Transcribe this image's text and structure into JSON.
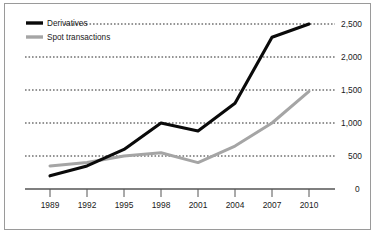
{
  "chart_data": {
    "type": "line",
    "title": "",
    "subtitle": "",
    "xlabel": "",
    "ylabel": "",
    "categories": [
      "1989",
      "1992",
      "1995",
      "1998",
      "2001",
      "2004",
      "2007",
      "2010"
    ],
    "x": [
      1989,
      1992,
      1995,
      1998,
      2001,
      2004,
      2007,
      2010
    ],
    "series": [
      {
        "name": "Derivatives",
        "color": "#0a0a0a",
        "values": [
          200,
          350,
          600,
          1000,
          880,
          1300,
          2300,
          2500
        ]
      },
      {
        "name": "Spot transactions",
        "color": "#a5a5a5",
        "values": [
          350,
          400,
          500,
          550,
          400,
          650,
          1000,
          1480
        ]
      }
    ],
    "ylim": [
      0,
      2500
    ],
    "ytick_values": [
      0,
      500,
      1000,
      1500,
      2000,
      2500
    ],
    "ytick_labels": [
      "0",
      "500",
      "1,000",
      "1,500",
      "2,000",
      "2,500"
    ],
    "ytick_position": "right",
    "xtick_labels": [
      "1989",
      "1992",
      "1995",
      "1998",
      "2001",
      "2004",
      "2007",
      "2010"
    ],
    "grid": true,
    "grid_style": "dotted-horizontal",
    "legend_position": "top-left",
    "legend": [
      {
        "label": "Derivatives",
        "color": "#0a0a0a"
      },
      {
        "label": "Spot transactions",
        "color": "#a5a5a5"
      }
    ],
    "annotations": []
  },
  "frame": {
    "border_color": "#9a9a9a",
    "background_color": "#ffffff"
  }
}
